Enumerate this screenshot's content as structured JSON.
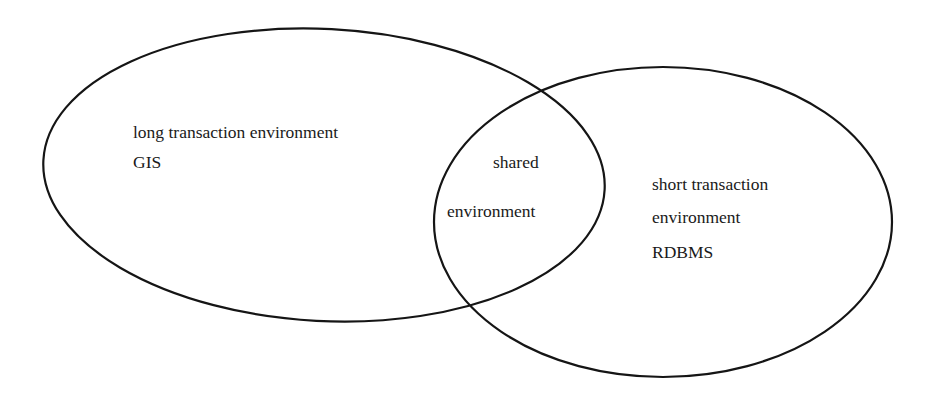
{
  "diagram": {
    "type": "venn",
    "stroke_color": "#151515",
    "background": "#ffffff",
    "sets": [
      {
        "id": "long",
        "lines": [
          "long transaction environment",
          "GIS"
        ],
        "ellipse": {
          "cx": 324,
          "cy": 175,
          "rx": 281,
          "ry": 146
        }
      },
      {
        "id": "short",
        "lines": [
          "short transaction",
          "environment",
          "RDBMS"
        ],
        "ellipse": {
          "cx": 663,
          "cy": 222,
          "rx": 229,
          "ry": 155
        }
      }
    ],
    "intersection": {
      "lines": [
        "shared",
        "environment"
      ]
    }
  }
}
